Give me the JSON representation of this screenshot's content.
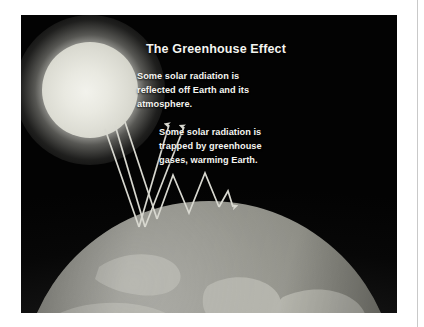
{
  "figure": {
    "title": "The Greenhouse Effect",
    "captions": {
      "reflected": "Some solar radiation is\nreflected off Earth and its\natmosphere.",
      "trapped": "Some solar radiation is\ntrapped by greenhouse\ngases, warming Earth."
    },
    "elements": {
      "sun_label": "sun",
      "earth_label": "earth",
      "atmosphere_label": "atmosphere"
    },
    "colors": {
      "background": "#050505",
      "sun": "#e9e9e1",
      "earth_land": "#b5b5ad",
      "earth_ocean": "#7c7c74",
      "atmosphere": "#989896",
      "ray": "#d8d8d0",
      "text": "#f4f4f0"
    }
  }
}
